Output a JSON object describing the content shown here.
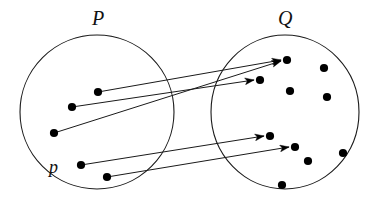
{
  "diagram": {
    "type": "set-mapping-venn",
    "title": "",
    "width": 383,
    "height": 207,
    "background_color": "#ffffff",
    "stroke_color": "#1a1a1a",
    "dot_color": "#000000",
    "circle_stroke_width": 1.1,
    "arrow_stroke_width": 1.0,
    "dot_radius": 4.0,
    "sets": [
      {
        "id": "P",
        "label": "P",
        "label_style": "italic-serif",
        "label_x": 100,
        "label_y": 19,
        "center_x": 97,
        "center_y": 112,
        "radius_x": 77,
        "radius_y": 77,
        "elements": [
          {
            "id": "p1",
            "x": 98,
            "y": 92,
            "label": ""
          },
          {
            "id": "p2",
            "x": 72,
            "y": 107,
            "label": ""
          },
          {
            "id": "p3",
            "x": 54,
            "y": 133,
            "label": ""
          },
          {
            "id": "p4",
            "x": 81,
            "y": 165,
            "label": "p"
          },
          {
            "id": "p5",
            "x": 107,
            "y": 177,
            "label": ""
          }
        ]
      },
      {
        "id": "Q",
        "label": "Q",
        "label_style": "italic-serif",
        "label_x": 286,
        "label_y": 19,
        "center_x": 285,
        "center_y": 112,
        "radius_x": 74,
        "radius_y": 77,
        "elements": [
          {
            "id": "q1",
            "x": 287,
            "y": 60,
            "label": ""
          },
          {
            "id": "q2",
            "x": 324,
            "y": 68,
            "label": ""
          },
          {
            "id": "q3",
            "x": 260,
            "y": 80,
            "label": ""
          },
          {
            "id": "q4",
            "x": 290,
            "y": 91,
            "label": ""
          },
          {
            "id": "q5",
            "x": 327,
            "y": 97,
            "label": ""
          },
          {
            "id": "q6",
            "x": 270,
            "y": 136,
            "label": ""
          },
          {
            "id": "q7",
            "x": 295,
            "y": 147,
            "label": ""
          },
          {
            "id": "q8",
            "x": 343,
            "y": 153,
            "label": ""
          },
          {
            "id": "q9",
            "x": 308,
            "y": 161,
            "label": ""
          },
          {
            "id": "q10",
            "x": 282,
            "y": 185,
            "label": ""
          }
        ]
      }
    ],
    "element_label": {
      "text": "p",
      "x": 56,
      "y": 167,
      "style": "italic-serif"
    },
    "mappings": [
      {
        "id": "m1",
        "from": "p1",
        "to": "q1",
        "x1": 98,
        "y1": 92,
        "x2": 283,
        "y2": 60
      },
      {
        "id": "m2",
        "from": "p2",
        "to": "q3",
        "x1": 72,
        "y1": 107,
        "x2": 256,
        "y2": 80
      },
      {
        "id": "m3",
        "from": "p3",
        "to": "q1b",
        "x1": 54,
        "y1": 133,
        "x2": 256,
        "y2": 81
      },
      {
        "id": "m4",
        "from": "p4",
        "to": "q6",
        "x1": 81,
        "y1": 165,
        "x2": 266,
        "y2": 136
      },
      {
        "id": "m5",
        "from": "p5",
        "to": "q7",
        "x1": 107,
        "y1": 177,
        "x2": 291,
        "y2": 147
      }
    ],
    "arrow_head": {
      "length": 9,
      "width": 7
    }
  }
}
